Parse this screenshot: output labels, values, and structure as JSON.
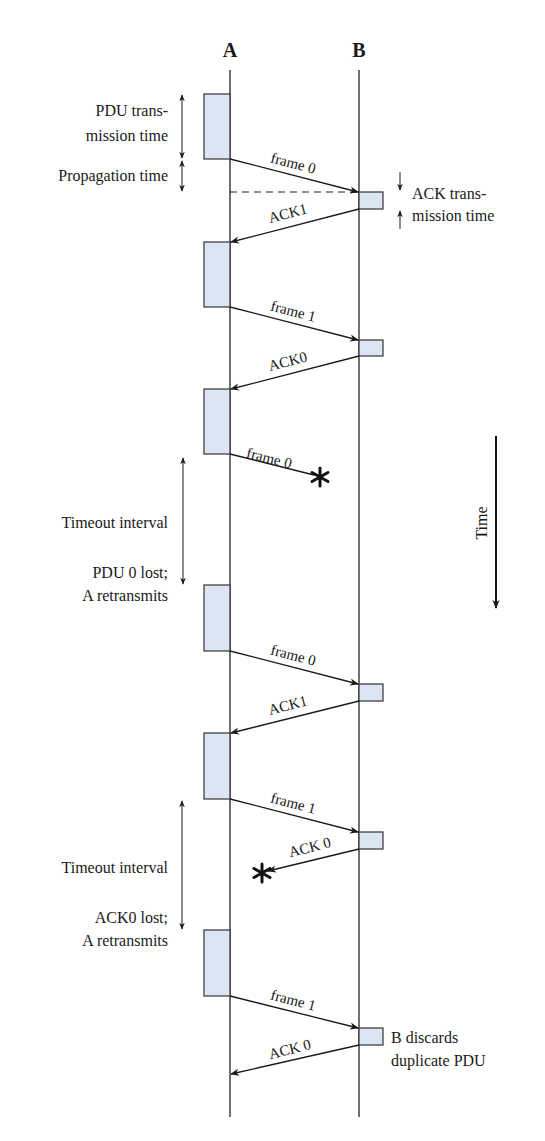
{
  "diagram": {
    "stations": [
      {
        "id": "A",
        "label": "A",
        "x": 230
      },
      {
        "id": "B",
        "label": "B",
        "x": 359
      }
    ],
    "colors": {
      "box_fill": "#dce6f2",
      "box_stroke": "#333333",
      "line": "#222222"
    },
    "annotations": {
      "pdu_tx_line1": "PDU trans-",
      "pdu_tx_line2": "mission time",
      "propagation": "Propagation time",
      "ack_tx_line1": "ACK trans-",
      "ack_tx_line2": "mission time",
      "timeout1": "Timeout interval",
      "lost1_line1": "PDU 0 lost;",
      "lost1_line2": "A retransmits",
      "timeout2": "Timeout interval",
      "lost2_line1": "ACK0 lost;",
      "lost2_line2": "A retransmits",
      "discard_line1": "B discards",
      "discard_line2": "duplicate PDU",
      "time_axis": "Time"
    },
    "messages": [
      {
        "label": "frame 0",
        "from": "A",
        "to": "B",
        "status": "delivered"
      },
      {
        "label": "ACK1",
        "from": "B",
        "to": "A",
        "status": "delivered"
      },
      {
        "label": "frame 1",
        "from": "A",
        "to": "B",
        "status": "delivered"
      },
      {
        "label": "ACK0",
        "from": "B",
        "to": "A",
        "status": "delivered"
      },
      {
        "label": "frame 0",
        "from": "A",
        "to": "B",
        "status": "lost"
      },
      {
        "label": "frame 0",
        "from": "A",
        "to": "B",
        "status": "delivered"
      },
      {
        "label": "ACK1",
        "from": "B",
        "to": "A",
        "status": "delivered"
      },
      {
        "label": "frame 1",
        "from": "A",
        "to": "B",
        "status": "delivered"
      },
      {
        "label": "ACK 0",
        "from": "B",
        "to": "A",
        "status": "lost"
      },
      {
        "label": "frame 1",
        "from": "A",
        "to": "B",
        "status": "delivered"
      },
      {
        "label": "ACK 0",
        "from": "B",
        "to": "A",
        "status": "delivered"
      }
    ]
  }
}
